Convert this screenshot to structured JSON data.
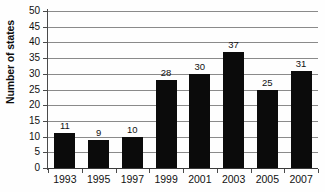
{
  "chart_data": {
    "type": "bar",
    "title": "",
    "xlabel": "",
    "ylabel": "Number of states",
    "categories": [
      "1993",
      "1995",
      "1997",
      "1999",
      "2001",
      "2003",
      "2005",
      "2007"
    ],
    "values": [
      11,
      9,
      10,
      28,
      30,
      37,
      25,
      31
    ],
    "value_labels": [
      "11",
      "9",
      "10",
      "28",
      "30",
      "37",
      "25",
      "31"
    ],
    "ylim": [
      0,
      50
    ],
    "ytick_step": 5,
    "ytick_labels": [
      "0",
      "5",
      "10",
      "15",
      "20",
      "25",
      "30",
      "35",
      "40",
      "45",
      "50"
    ],
    "grid": true,
    "grid_orientation": "horizontal",
    "legend": null,
    "legend_position": "none",
    "bar_color": "#0b0b0b",
    "grid_color": "#8a8a8a",
    "axis_color": "#3a3a3a",
    "background_color": "#fefefe",
    "text_color": "#111111",
    "data_labels_shown": true
  }
}
